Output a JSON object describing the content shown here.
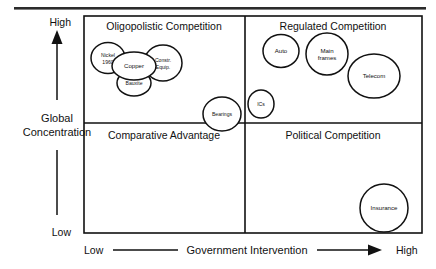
{
  "diagram": {
    "type": "scatter",
    "top_rule": true,
    "y_axis": {
      "label_line1": "Global",
      "label_line2": "Concentration",
      "high_label": "High",
      "low_label": "Low",
      "arrow_direction": "up"
    },
    "x_axis": {
      "label": "Government Intervention",
      "low_label": "Low",
      "high_label": "High",
      "arrow_direction": "right"
    },
    "quadrants": [
      {
        "id": "top-left",
        "title": "Oligopolistic Competition"
      },
      {
        "id": "top-right",
        "title": "Regulated Competition"
      },
      {
        "id": "bottom-left",
        "title": "Comparative Advantage"
      },
      {
        "id": "bottom-right",
        "title": "Political Competition"
      }
    ],
    "bubbles": [
      {
        "id": "nickel",
        "label": "Nickel",
        "label2": "1960",
        "cx": 108,
        "cy": 58,
        "rx": 17,
        "ry": 15.5,
        "size": "sm"
      },
      {
        "id": "copper",
        "label": "Copper",
        "cx": 134,
        "cy": 66,
        "rx": 22,
        "ry": 14,
        "size": "md"
      },
      {
        "id": "constr-equip",
        "label": "Constr.",
        "label2": "Equip.",
        "cx": 163,
        "cy": 63,
        "rx": 19,
        "ry": 18,
        "size": "sm"
      },
      {
        "id": "bauxite",
        "label": "Bauxite",
        "cx": 134,
        "cy": 83,
        "rx": 17,
        "ry": 13,
        "size": "sm"
      },
      {
        "id": "bearings",
        "label": "Bearings",
        "cx": 222,
        "cy": 114,
        "rx": 19,
        "ry": 17,
        "size": "sm"
      },
      {
        "id": "ics",
        "label": "ICs",
        "cx": 261,
        "cy": 104,
        "rx": 13,
        "ry": 14,
        "size": "sm"
      },
      {
        "id": "auto",
        "label": "Auto",
        "cx": 281,
        "cy": 51,
        "rx": 18,
        "ry": 16.5,
        "size": "md"
      },
      {
        "id": "main-frames",
        "label": "Main",
        "label2": "frames",
        "cx": 327,
        "cy": 54,
        "rx": 21,
        "ry": 21,
        "size": "md"
      },
      {
        "id": "telecom",
        "label": "Telecom",
        "cx": 374,
        "cy": 76,
        "rx": 26,
        "ry": 22,
        "size": "md"
      },
      {
        "id": "insurance",
        "label": "Insurance",
        "cx": 384,
        "cy": 208,
        "rx": 24,
        "ry": 24,
        "size": "md"
      }
    ],
    "colors": {
      "stroke": "#111111",
      "background": "#ffffff",
      "rule": "#2b2b2b"
    }
  }
}
